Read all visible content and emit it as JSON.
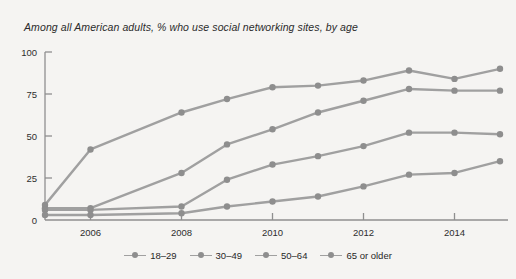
{
  "subtitle": "Among all American adults, % who use social networking sites, by age",
  "legend": {
    "items": [
      {
        "label": "18–29"
      },
      {
        "label": "30–49"
      },
      {
        "label": "50–64"
      },
      {
        "label": "65 or older"
      }
    ]
  },
  "colors": {
    "background": "#f5f4f2",
    "line": "#a0a0a0",
    "marker": "#8e8e8e",
    "axis": "#8f8f8f",
    "text": "#2b2b2b"
  },
  "chart_data": {
    "type": "line",
    "title": "",
    "subtitle": "Among all American adults, % who use social networking sites, by age",
    "xlabel": "",
    "ylabel": "",
    "xlim": [
      2005,
      2015
    ],
    "ylim": [
      0,
      100
    ],
    "yticks": [
      0,
      25,
      50,
      75,
      100
    ],
    "ytick_labels": [
      "0",
      "25",
      "50",
      "75",
      "100"
    ],
    "xticks": [
      2006,
      2008,
      2010,
      2012,
      2014
    ],
    "xtick_labels": [
      "2006",
      "2008",
      "2010",
      "2012",
      "2014"
    ],
    "grid": false,
    "legend_position": "bottom",
    "x": [
      2005,
      2006,
      2008,
      2009,
      2010,
      2011,
      2012,
      2013,
      2014,
      2015
    ],
    "series": [
      {
        "name": "18–29",
        "values": [
          9,
          42,
          64,
          72,
          79,
          80,
          83,
          89,
          84,
          90
        ]
      },
      {
        "name": "30–49",
        "values": [
          7,
          7,
          28,
          45,
          54,
          64,
          71,
          78,
          77,
          77
        ]
      },
      {
        "name": "50–64",
        "values": [
          6,
          6,
          8,
          24,
          33,
          38,
          44,
          52,
          52,
          51
        ]
      },
      {
        "name": "65 or older",
        "values": [
          3,
          3,
          4,
          8,
          11,
          14,
          20,
          27,
          28,
          35
        ]
      }
    ]
  }
}
